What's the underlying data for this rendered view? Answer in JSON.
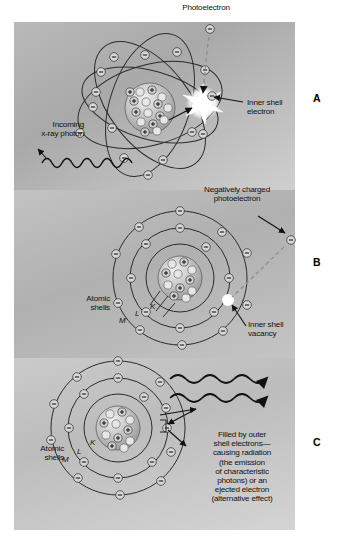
{
  "figure": {
    "background_color": "#b4b4b4",
    "ink_color": "#111111"
  },
  "panels": [
    {
      "marker": "A",
      "name": "photoelectric-interaction",
      "labels": [
        {
          "name": "photoelectron-label",
          "text": "Photoelectron"
        },
        {
          "name": "incoming-photon-label",
          "text": "Incoming\nx-ray photon"
        },
        {
          "name": "inner-shell-electron-label",
          "text": "Inner shell\nelectron"
        }
      ],
      "shell_labels": []
    },
    {
      "marker": "B",
      "name": "vacancy-created",
      "labels": [
        {
          "name": "negatively-charged-photoelectron-label",
          "text": "Negatively charged\nphotoelectron"
        },
        {
          "name": "atomic-shells-label",
          "text": "Atomic\nshells"
        },
        {
          "name": "inner-shell-vacancy-label",
          "text": "Inner shell\nvacancy"
        }
      ],
      "shell_labels": [
        "K",
        "L",
        "M"
      ]
    },
    {
      "marker": "C",
      "name": "characteristic-radiation",
      "labels": [
        {
          "name": "atomic-shells-label",
          "text": "Atomic\nshells"
        },
        {
          "name": "filled-by-outer-shell-label",
          "text": "Filled by outer\nshell electrons—\ncausing radiation\n(the emission\nof characteristic\nphotons) or an\nejected electron\n(alternative effect)"
        }
      ],
      "shell_labels": [
        "K",
        "L",
        "M"
      ]
    }
  ],
  "glyphs": {
    "electron_sign": "−",
    "proton_sign": "+"
  }
}
